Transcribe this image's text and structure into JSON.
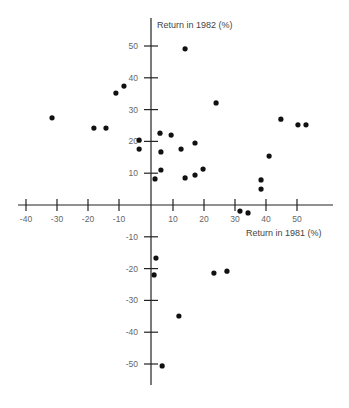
{
  "chart_data": {
    "type": "scatter",
    "title": "",
    "xlabel": "Return in 1981 (%)",
    "ylabel": "Return in 1982 (%)",
    "xlim": [
      -45,
      58
    ],
    "ylim": [
      -57,
      58
    ],
    "grid": false,
    "legend": null,
    "x_ticks": [
      -40,
      -30,
      -20,
      -10,
      10,
      20,
      30,
      40,
      50
    ],
    "x_tick_labels": [
      "-40",
      "-30",
      "-20",
      "-10",
      "10",
      "20",
      "30",
      "40",
      "50"
    ],
    "y_ticks": [
      50,
      40,
      30,
      20,
      10,
      -10,
      -20,
      -30,
      -40,
      -50
    ],
    "y_tick_labels": [
      "50",
      "40",
      "30",
      "20",
      "10",
      "-10",
      "-20",
      "-30",
      "-40",
      "-50"
    ],
    "points": [
      {
        "x": -31.6,
        "y": 27.4
      },
      {
        "x": -18.1,
        "y": 24.2
      },
      {
        "x": -14.2,
        "y": 24.2
      },
      {
        "x": -11.0,
        "y": 35.2
      },
      {
        "x": -8.4,
        "y": 37.4
      },
      {
        "x": -3.5,
        "y": 20.4
      },
      {
        "x": -3.5,
        "y": 17.6
      },
      {
        "x": 4.2,
        "y": 8.2
      },
      {
        "x": 5.8,
        "y": 22.6
      },
      {
        "x": 6.1,
        "y": 16.7
      },
      {
        "x": 6.1,
        "y": 11.0
      },
      {
        "x": 9.4,
        "y": 22.0
      },
      {
        "x": 12.6,
        "y": 17.6
      },
      {
        "x": 13.9,
        "y": 49.1
      },
      {
        "x": 13.9,
        "y": 8.5
      },
      {
        "x": 17.1,
        "y": 19.5
      },
      {
        "x": 17.1,
        "y": 9.4
      },
      {
        "x": 19.7,
        "y": 11.3
      },
      {
        "x": 23.9,
        "y": 32.1
      },
      {
        "x": 31.6,
        "y": -1.9
      },
      {
        "x": 34.2,
        "y": -2.5
      },
      {
        "x": 38.4,
        "y": 7.9
      },
      {
        "x": 38.4,
        "y": 5.0
      },
      {
        "x": 41.0,
        "y": 15.4
      },
      {
        "x": 44.8,
        "y": 27.0
      },
      {
        "x": 50.3,
        "y": 25.2
      },
      {
        "x": 52.9,
        "y": 25.2
      },
      {
        "x": 4.5,
        "y": -16.7
      },
      {
        "x": 3.9,
        "y": -22.0
      },
      {
        "x": 23.2,
        "y": -21.4
      },
      {
        "x": 27.4,
        "y": -20.8
      },
      {
        "x": 11.9,
        "y": -34.9
      },
      {
        "x": 6.5,
        "y": -50.6
      }
    ]
  },
  "labels": {
    "x_axis_title": "Return in 1981 (%)",
    "y_axis_title": "Return in 1982 (%)"
  }
}
